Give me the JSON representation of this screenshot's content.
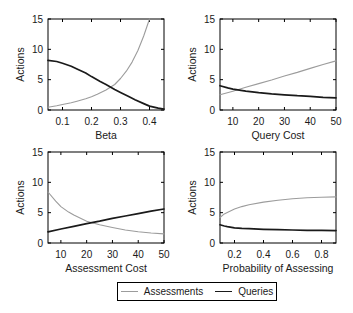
{
  "figure": {
    "background": "#ffffff"
  },
  "legend": {
    "items": [
      {
        "label": "Assessments",
        "color": "#9c9c9c"
      },
      {
        "label": "Queries",
        "color": "#1a1a1a"
      }
    ]
  },
  "chart_data": [
    {
      "type": "line",
      "title": "",
      "xlabel": "Beta",
      "ylabel": "Actions",
      "xlim": [
        0.05,
        0.45
      ],
      "ylim": [
        0,
        15
      ],
      "xticks": [
        0.1,
        0.2,
        0.3,
        0.4
      ],
      "xtick_labels": [
        "0.1",
        "0.2",
        "0.3",
        "0.4"
      ],
      "yticks": [
        0,
        5,
        10,
        15
      ],
      "ytick_labels": [
        "0",
        "5",
        "10",
        "15"
      ],
      "grid": false,
      "legend_position": "none",
      "series": [
        {
          "name": "Assessments",
          "color": "#9c9c9c",
          "width": 1.1,
          "points": [
            [
              0.05,
              0.45
            ],
            [
              0.08,
              0.7
            ],
            [
              0.1,
              0.9
            ],
            [
              0.13,
              1.2
            ],
            [
              0.15,
              1.45
            ],
            [
              0.18,
              1.85
            ],
            [
              0.2,
              2.2
            ],
            [
              0.22,
              2.6
            ],
            [
              0.25,
              3.3
            ],
            [
              0.28,
              4.2
            ],
            [
              0.3,
              5.2
            ],
            [
              0.32,
              6.4
            ],
            [
              0.34,
              7.9
            ],
            [
              0.36,
              9.8
            ],
            [
              0.38,
              12.2
            ],
            [
              0.4,
              15
            ]
          ]
        },
        {
          "name": "Queries",
          "color": "#1a1a1a",
          "width": 1.7,
          "points": [
            [
              0.05,
              8.2
            ],
            [
              0.08,
              8.0
            ],
            [
              0.1,
              7.7
            ],
            [
              0.13,
              7.2
            ],
            [
              0.15,
              6.75
            ],
            [
              0.18,
              6.1
            ],
            [
              0.2,
              5.5
            ],
            [
              0.23,
              4.7
            ],
            [
              0.25,
              4.2
            ],
            [
              0.28,
              3.4
            ],
            [
              0.3,
              2.9
            ],
            [
              0.33,
              2.2
            ],
            [
              0.35,
              1.7
            ],
            [
              0.38,
              1.05
            ],
            [
              0.4,
              0.65
            ],
            [
              0.43,
              0.3
            ],
            [
              0.45,
              0.15
            ]
          ]
        }
      ]
    },
    {
      "type": "line",
      "title": "",
      "xlabel": "Query Cost",
      "ylabel": "Actions",
      "xlim": [
        5,
        50
      ],
      "ylim": [
        0,
        15
      ],
      "xticks": [
        10,
        20,
        30,
        40,
        50
      ],
      "xtick_labels": [
        "10",
        "20",
        "30",
        "40",
        "50"
      ],
      "yticks": [
        0,
        5,
        10,
        15
      ],
      "ytick_labels": [
        "0",
        "5",
        "10",
        "15"
      ],
      "grid": false,
      "legend_position": "none",
      "series": [
        {
          "name": "Assessments",
          "color": "#9c9c9c",
          "width": 1.1,
          "points": [
            [
              5,
              2.5
            ],
            [
              10,
              3.1
            ],
            [
              15,
              3.75
            ],
            [
              20,
              4.35
            ],
            [
              25,
              4.95
            ],
            [
              30,
              5.6
            ],
            [
              35,
              6.2
            ],
            [
              40,
              6.85
            ],
            [
              45,
              7.5
            ],
            [
              50,
              8.1
            ]
          ]
        },
        {
          "name": "Queries",
          "color": "#1a1a1a",
          "width": 1.7,
          "points": [
            [
              5,
              4.0
            ],
            [
              8,
              3.65
            ],
            [
              10,
              3.45
            ],
            [
              15,
              3.1
            ],
            [
              20,
              2.85
            ],
            [
              25,
              2.65
            ],
            [
              30,
              2.5
            ],
            [
              35,
              2.35
            ],
            [
              40,
              2.25
            ],
            [
              45,
              2.1
            ],
            [
              50,
              2.0
            ]
          ]
        }
      ]
    },
    {
      "type": "line",
      "title": "",
      "xlabel": "Assessment Cost",
      "ylabel": "Actions",
      "xlim": [
        5,
        50
      ],
      "ylim": [
        0,
        15
      ],
      "xticks": [
        10,
        20,
        30,
        40,
        50
      ],
      "xtick_labels": [
        "10",
        "20",
        "30",
        "40",
        "50"
      ],
      "yticks": [
        0,
        5,
        10,
        15
      ],
      "ytick_labels": [
        "0",
        "5",
        "10",
        "15"
      ],
      "grid": false,
      "legend_position": "none",
      "series": [
        {
          "name": "Assessments",
          "color": "#9c9c9c",
          "width": 1.1,
          "points": [
            [
              5,
              8.4
            ],
            [
              8,
              6.9
            ],
            [
              10,
              6.0
            ],
            [
              13,
              5.1
            ],
            [
              15,
              4.6
            ],
            [
              20,
              3.6
            ],
            [
              25,
              3.0
            ],
            [
              30,
              2.55
            ],
            [
              35,
              2.15
            ],
            [
              40,
              1.85
            ],
            [
              45,
              1.65
            ],
            [
              50,
              1.5
            ]
          ]
        },
        {
          "name": "Queries",
          "color": "#1a1a1a",
          "width": 1.7,
          "points": [
            [
              5,
              1.85
            ],
            [
              10,
              2.3
            ],
            [
              15,
              2.75
            ],
            [
              20,
              3.2
            ],
            [
              25,
              3.6
            ],
            [
              30,
              4.05
            ],
            [
              35,
              4.45
            ],
            [
              40,
              4.85
            ],
            [
              45,
              5.25
            ],
            [
              50,
              5.6
            ]
          ]
        }
      ]
    },
    {
      "type": "line",
      "title": "",
      "xlabel": "Probability of Assessing",
      "ylabel": "Actions",
      "xlim": [
        0.1,
        0.9
      ],
      "ylim": [
        0,
        15
      ],
      "xticks": [
        0.2,
        0.4,
        0.6,
        0.8
      ],
      "xtick_labels": [
        "0.2",
        "0.4",
        "0.6",
        "0.8"
      ],
      "yticks": [
        0,
        5,
        10,
        15
      ],
      "ytick_labels": [
        "0",
        "5",
        "10",
        "15"
      ],
      "grid": false,
      "legend_position": "none",
      "series": [
        {
          "name": "Assessments",
          "color": "#9c9c9c",
          "width": 1.1,
          "points": [
            [
              0.1,
              4.2
            ],
            [
              0.13,
              4.8
            ],
            [
              0.15,
              5.05
            ],
            [
              0.2,
              5.6
            ],
            [
              0.25,
              6.0
            ],
            [
              0.3,
              6.3
            ],
            [
              0.4,
              6.75
            ],
            [
              0.5,
              7.05
            ],
            [
              0.6,
              7.3
            ],
            [
              0.7,
              7.45
            ],
            [
              0.8,
              7.55
            ],
            [
              0.9,
              7.6
            ]
          ]
        },
        {
          "name": "Queries",
          "color": "#1a1a1a",
          "width": 1.7,
          "points": [
            [
              0.1,
              3.0
            ],
            [
              0.13,
              2.8
            ],
            [
              0.15,
              2.7
            ],
            [
              0.2,
              2.5
            ],
            [
              0.25,
              2.4
            ],
            [
              0.3,
              2.35
            ],
            [
              0.4,
              2.25
            ],
            [
              0.5,
              2.2
            ],
            [
              0.6,
              2.15
            ],
            [
              0.7,
              2.1
            ],
            [
              0.8,
              2.1
            ],
            [
              0.9,
              2.05
            ]
          ]
        }
      ]
    }
  ]
}
